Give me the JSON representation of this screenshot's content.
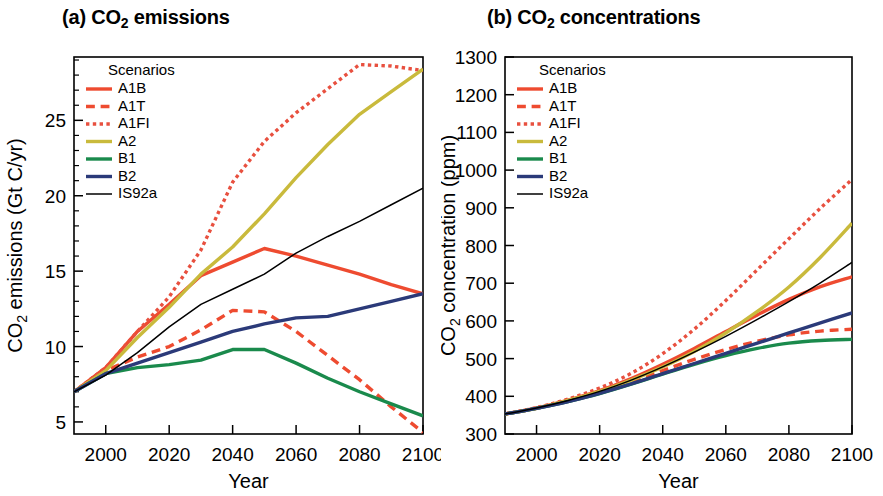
{
  "figure": {
    "width": 883,
    "height": 496,
    "background": "#ffffff"
  },
  "colors": {
    "A1B": "#ee4b30",
    "A1T": "#ee4b30",
    "A1FI": "#e8503f",
    "A2": "#c9ba3c",
    "B1": "#1a8a4c",
    "B2": "#2b3a79",
    "IS92a": "#000000",
    "axis": "#000000",
    "text": "#000000"
  },
  "legend": {
    "header": "Scenarios",
    "entries": [
      {
        "label": "A1B",
        "color": "#ee4b30",
        "style": "solid",
        "width": 3.4
      },
      {
        "label": "A1T",
        "color": "#ee4b30",
        "style": "dashed",
        "width": 3.4
      },
      {
        "label": "A1FI",
        "color": "#e8503f",
        "style": "dotted",
        "width": 3.4
      },
      {
        "label": "A2",
        "color": "#c9ba3c",
        "style": "solid",
        "width": 3.4
      },
      {
        "label": "B1",
        "color": "#1a8a4c",
        "style": "solid",
        "width": 3.4
      },
      {
        "label": "B2",
        "color": "#2b3a79",
        "style": "solid",
        "width": 3.4
      },
      {
        "label": "IS92a",
        "color": "#000000",
        "style": "solid",
        "width": 1.5
      }
    ]
  },
  "chart_data": [
    {
      "id": "emissions",
      "type": "line",
      "title": "(a) CO2 emissions",
      "title_prefix": "(a) CO",
      "title_sub": "2",
      "title_suffix": " emissions",
      "xlabel": "Year",
      "ylabel": "CO2 emissions (Gt C/yr)",
      "ylabel_prefix": "CO",
      "ylabel_sub": "2",
      "ylabel_suffix": " emissions (Gt C/yr)",
      "xlim": [
        1990,
        2100
      ],
      "ylim": [
        4.2,
        29.2
      ],
      "xticks": [
        2000,
        2020,
        2040,
        2060,
        2080,
        2100
      ],
      "xtick_labels": [
        "2000",
        "2020",
        "2040",
        "2060",
        "2080",
        "2100"
      ],
      "yticks": [
        5,
        10,
        15,
        20,
        25
      ],
      "ytick_labels": [
        "5",
        "10",
        "15",
        "20",
        "25"
      ],
      "yminor_step": 1,
      "grid": false,
      "legend_position": "top-left",
      "x": [
        1990,
        2000,
        2010,
        2020,
        2030,
        2040,
        2050,
        2060,
        2070,
        2080,
        2090,
        2100
      ],
      "series": [
        {
          "name": "A1B",
          "color": "#ee4b30",
          "style": "solid",
          "width": 3.4,
          "values": [
            7.0,
            8.6,
            11.0,
            12.8,
            14.7,
            15.6,
            16.5,
            16.0,
            15.4,
            14.8,
            14.1,
            13.5
          ]
        },
        {
          "name": "A1T",
          "color": "#ee4b30",
          "style": "dashed",
          "width": 3.4,
          "values": [
            7.0,
            8.4,
            9.3,
            10.0,
            11.1,
            12.4,
            12.3,
            11.0,
            9.4,
            7.8,
            6.0,
            4.3
          ]
        },
        {
          "name": "A1FI",
          "color": "#e8503f",
          "style": "dotted",
          "width": 3.4,
          "values": [
            7.0,
            8.6,
            11.0,
            13.3,
            16.4,
            20.9,
            23.6,
            25.5,
            27.1,
            28.7,
            28.6,
            28.3
          ]
        },
        {
          "name": "A2",
          "color": "#c9ba3c",
          "style": "solid",
          "width": 3.4,
          "values": [
            7.0,
            8.4,
            10.6,
            12.6,
            14.8,
            16.6,
            18.8,
            21.2,
            23.4,
            25.4,
            26.9,
            28.4
          ]
        },
        {
          "name": "B1",
          "color": "#1a8a4c",
          "style": "solid",
          "width": 3.4,
          "values": [
            7.0,
            8.2,
            8.6,
            8.8,
            9.1,
            9.8,
            9.8,
            8.9,
            7.9,
            7.0,
            6.2,
            5.4
          ]
        },
        {
          "name": "B2",
          "color": "#2b3a79",
          "style": "solid",
          "width": 3.4,
          "values": [
            7.0,
            8.2,
            8.9,
            9.6,
            10.3,
            11.0,
            11.5,
            11.9,
            12.0,
            12.5,
            13.0,
            13.5
          ]
        },
        {
          "name": "IS92a",
          "color": "#000000",
          "style": "solid",
          "width": 1.5,
          "values": [
            7.0,
            8.1,
            9.6,
            11.3,
            12.8,
            13.8,
            14.8,
            16.2,
            17.3,
            18.3,
            19.4,
            20.5
          ]
        }
      ]
    },
    {
      "id": "concentrations",
      "type": "line",
      "title": "(b) CO2 concentrations",
      "title_prefix": "(b) CO",
      "title_sub": "2",
      "title_suffix": " concentrations",
      "xlabel": "Year",
      "ylabel": "CO2 concentration (ppm)",
      "ylabel_prefix": "CO",
      "ylabel_sub": "2",
      "ylabel_suffix": " concentration (ppm)",
      "xlim": [
        1990,
        2100
      ],
      "ylim": [
        300,
        1300
      ],
      "xticks": [
        2000,
        2020,
        2040,
        2060,
        2080,
        2100
      ],
      "xtick_labels": [
        "2000",
        "2020",
        "2040",
        "2060",
        "2080",
        "2100"
      ],
      "yticks": [
        300,
        400,
        500,
        600,
        700,
        800,
        900,
        1000,
        1100,
        1200,
        1300
      ],
      "ytick_labels": [
        "300",
        "400",
        "500",
        "600",
        "700",
        "800",
        "900",
        "1000",
        "1100",
        "1200",
        "1300"
      ],
      "yminor_step": 0,
      "grid": false,
      "legend_position": "top-left",
      "x": [
        1990,
        2000,
        2010,
        2020,
        2030,
        2040,
        2050,
        2060,
        2070,
        2080,
        2090,
        2100
      ],
      "series": [
        {
          "name": "A1B",
          "color": "#ee4b30",
          "style": "solid",
          "width": 3.4,
          "values": [
            353,
            369,
            390,
            415,
            447,
            485,
            527,
            572,
            616,
            657,
            691,
            717
          ]
        },
        {
          "name": "A1T",
          "color": "#ee4b30",
          "style": "dashed",
          "width": 3.4,
          "values": [
            353,
            368,
            387,
            410,
            438,
            468,
            498,
            524,
            546,
            563,
            573,
            578
          ]
        },
        {
          "name": "A1FI",
          "color": "#e8503f",
          "style": "dotted",
          "width": 3.4,
          "values": [
            353,
            370,
            393,
            422,
            461,
            513,
            578,
            654,
            736,
            818,
            899,
            975
          ]
        },
        {
          "name": "A2",
          "color": "#c9ba3c",
          "style": "solid",
          "width": 3.4,
          "values": [
            353,
            368,
            389,
            413,
            443,
            478,
            519,
            568,
            625,
            690,
            769,
            859
          ]
        },
        {
          "name": "B1",
          "color": "#1a8a4c",
          "style": "solid",
          "width": 3.4,
          "values": [
            353,
            368,
            386,
            407,
            432,
            459,
            485,
            508,
            527,
            541,
            548,
            551
          ]
        },
        {
          "name": "B2",
          "color": "#2b3a79",
          "style": "solid",
          "width": 3.4,
          "values": [
            353,
            368,
            386,
            408,
            433,
            460,
            487,
            514,
            541,
            568,
            595,
            621
          ]
        },
        {
          "name": "IS92a",
          "color": "#000000",
          "style": "solid",
          "width": 1.5,
          "values": [
            353,
            369,
            389,
            413,
            443,
            478,
            517,
            559,
            604,
            651,
            701,
            755
          ]
        }
      ]
    }
  ]
}
